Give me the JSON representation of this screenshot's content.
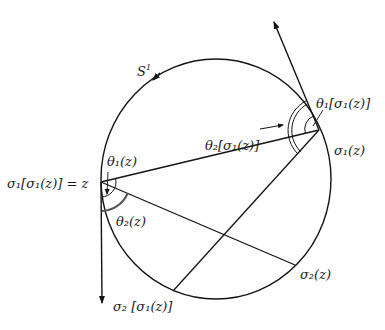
{
  "diagram": {
    "labels": {
      "circle": "S",
      "circle_sup": "1",
      "z_point": "σ₁[σ₁(z)] = z",
      "sigma1_z": "σ₁(z)",
      "sigma2_z": "σ₂(z)",
      "sigma2_sigma1_z": "σ₂ [σ₁(z)]",
      "theta1_z": "θ₁(z)",
      "theta2_z": "θ₂(z)",
      "theta1_sigma1_z": "θ₁[σ₁(z)]",
      "theta2_sigma1_z": "θ₂[σ₁(z)]"
    },
    "points": {
      "z": [
        101,
        182
      ],
      "sigma1_z": [
        319,
        130
      ],
      "sigma2_z": [
        295,
        265
      ],
      "sigma2_sigma1_z": [
        173,
        291
      ]
    },
    "circle": {
      "cx": 216,
      "cy": 179,
      "rx": 115,
      "ry": 120
    },
    "colors": {
      "ink": "#141414",
      "background": "#fefefe"
    }
  }
}
